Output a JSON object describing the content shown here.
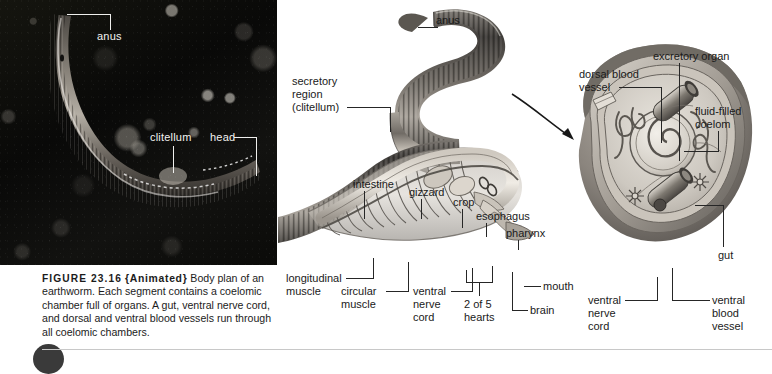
{
  "figure": {
    "number": "FIGURE 23.16",
    "animated_tag": "{Animated}",
    "caption_text": " Body plan of an earthworm. Each segment contains a coelomic chamber full of organs. A gut, ventral nerve cord, and dorsal and ventral blood vessels run through all coelomic chambers."
  },
  "photo": {
    "alt": "earthworm-on-soil-photograph",
    "labels": [
      {
        "id": "anus",
        "text": "anus"
      },
      {
        "id": "clitellum",
        "text": "clitellum"
      },
      {
        "id": "head",
        "text": "head"
      }
    ]
  },
  "whole_worm": {
    "alt": "cutaway-earthworm-illustration",
    "labels": [
      {
        "id": "anus",
        "text": "anus"
      },
      {
        "id": "secretory-region",
        "line1": "secretory",
        "line2": "region",
        "line3": "(clitellum)"
      },
      {
        "id": "intestine",
        "text": "intestine"
      },
      {
        "id": "gizzard",
        "text": "gizzard"
      },
      {
        "id": "crop",
        "text": "crop"
      },
      {
        "id": "esophagus",
        "text": "esophagus"
      },
      {
        "id": "pharynx",
        "text": "pharynx"
      },
      {
        "id": "mouth",
        "text": "mouth"
      },
      {
        "id": "brain",
        "text": "brain"
      },
      {
        "id": "hearts",
        "line1": "2 of 5",
        "line2": "hearts"
      },
      {
        "id": "ventral-nerve-cord",
        "line1": "ventral",
        "line2": "nerve",
        "line3": "cord"
      },
      {
        "id": "circular-muscle",
        "line1": "circular",
        "line2": "muscle"
      },
      {
        "id": "longitudinal-muscle",
        "line1": "longitudinal",
        "line2": "muscle"
      }
    ]
  },
  "cross_section": {
    "alt": "earthworm-segment-cross-section",
    "labels": [
      {
        "id": "excretory-organ",
        "text": "excretory organ"
      },
      {
        "id": "dorsal-blood-vessel",
        "line1": "dorsal blood",
        "line2": "vessel"
      },
      {
        "id": "fluid-filled-coelom",
        "line1": "fluid-filled",
        "line2": "coelom"
      },
      {
        "id": "gut",
        "text": "gut"
      },
      {
        "id": "ventral-blood-vessel",
        "line1": "ventral",
        "line2": "blood",
        "line3": "vessel"
      },
      {
        "id": "ventral-nerve-cord",
        "line1": "ventral",
        "line2": "nerve",
        "line3": "cord"
      }
    ]
  },
  "colors": {
    "photo_background": "#0a0a09",
    "label_text": "#1a1a1a",
    "photo_label_text": "#f2f2f0",
    "leader_line": "#262626",
    "page_background": "#ffffff"
  }
}
